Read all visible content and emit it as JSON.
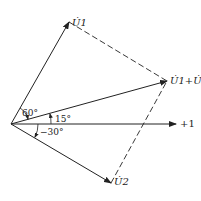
{
  "diagram": {
    "type": "phasor-diagram",
    "colors": {
      "line": "#222222",
      "background": "#ffffff"
    },
    "origin": [
      11,
      124
    ],
    "phasors": [
      {
        "id": "U1",
        "label": "U̇1",
        "angle_deg": 60,
        "tip": [
          69,
          22
        ]
      },
      {
        "id": "U2",
        "label": "U̇2",
        "angle_deg": -30,
        "tip": [
          111,
          183
        ]
      },
      {
        "id": "U1+U2",
        "label": "U̇1+U̇2",
        "angle_deg": 15,
        "tip": [
          167,
          81
        ]
      }
    ],
    "axis": {
      "label": "+1",
      "end": [
        176,
        124
      ]
    },
    "angle_labels": {
      "a60": "60°",
      "a15": "15°",
      "am30": "−30°"
    },
    "dashed_edges": [
      [
        "U1",
        "U1+U2"
      ],
      [
        "U2",
        "U1+U2"
      ]
    ]
  }
}
